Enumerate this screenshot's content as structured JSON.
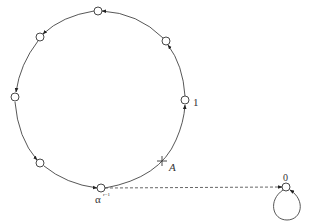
{
  "diagram": {
    "type": "state-transition-cycle",
    "stroke_color": "#444444",
    "main_cycle": {
      "center": [
        100,
        100
      ],
      "rx": 87,
      "ry": 89,
      "direction": "counterclockwise-arrows",
      "nodes": [
        {
          "id": "n1",
          "label": "1",
          "x": 185,
          "y": 100
        },
        {
          "id": "n2",
          "label": "",
          "x": 166,
          "y": 41
        },
        {
          "id": "n3",
          "label": "",
          "x": 98,
          "y": 11
        },
        {
          "id": "n4",
          "label": "",
          "x": 40,
          "y": 37
        },
        {
          "id": "n5",
          "label": "",
          "x": 15,
          "y": 97
        },
        {
          "id": "n6",
          "label": "",
          "x": 40,
          "y": 163
        },
        {
          "id": "n7",
          "label": "α",
          "label_sup": "r−1",
          "x": 101,
          "y": 188
        }
      ],
      "marker": {
        "symbol": "+",
        "label": "A",
        "x": 162,
        "y": 161
      }
    },
    "zero_node": {
      "label": "0",
      "x": 286,
      "y": 187,
      "self_loop": true
    },
    "dashed_edge": {
      "from": "n7",
      "to": "zero_node"
    }
  }
}
